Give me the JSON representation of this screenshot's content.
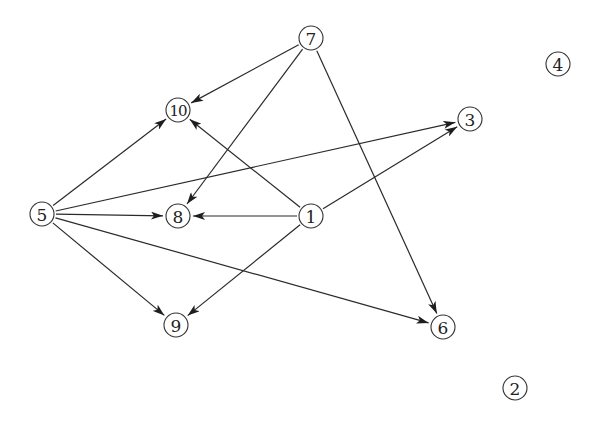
{
  "graph": {
    "type": "directed",
    "node_radius": 12,
    "colors": {
      "stroke": "#333333",
      "edge": "#2a2a2a",
      "background": "#ffffff",
      "text": "#222222"
    },
    "nodes": [
      {
        "id": "1",
        "label": "1",
        "x": 311,
        "y": 216
      },
      {
        "id": "2",
        "label": "2",
        "x": 515,
        "y": 388
      },
      {
        "id": "3",
        "label": "3",
        "x": 470,
        "y": 119
      },
      {
        "id": "4",
        "label": "4",
        "x": 558,
        "y": 64
      },
      {
        "id": "5",
        "label": "5",
        "x": 42,
        "y": 214
      },
      {
        "id": "6",
        "label": "6",
        "x": 443,
        "y": 327
      },
      {
        "id": "7",
        "label": "7",
        "x": 311,
        "y": 38
      },
      {
        "id": "8",
        "label": "8",
        "x": 178,
        "y": 216
      },
      {
        "id": "9",
        "label": "9",
        "x": 176,
        "y": 325
      },
      {
        "id": "10",
        "label": "10",
        "x": 178,
        "y": 110
      }
    ],
    "edges": [
      {
        "from": "7",
        "to": "10"
      },
      {
        "from": "7",
        "to": "8"
      },
      {
        "from": "7",
        "to": "6"
      },
      {
        "from": "5",
        "to": "10"
      },
      {
        "from": "5",
        "to": "3"
      },
      {
        "from": "5",
        "to": "8"
      },
      {
        "from": "5",
        "to": "9"
      },
      {
        "from": "5",
        "to": "6"
      },
      {
        "from": "1",
        "to": "10"
      },
      {
        "from": "1",
        "to": "3"
      },
      {
        "from": "1",
        "to": "8"
      },
      {
        "from": "1",
        "to": "9"
      }
    ]
  }
}
